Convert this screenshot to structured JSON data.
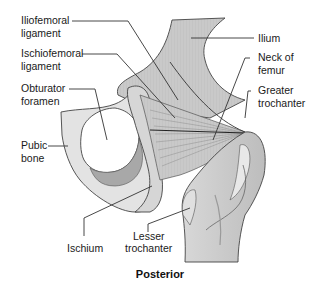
{
  "diagram": {
    "view_title": "Posterior",
    "labels": {
      "iliofemoral": [
        "Iliofemoral",
        "ligament"
      ],
      "ischiofemoral": [
        "Ischiofemoral",
        "ligament"
      ],
      "obturator": [
        "Obturator",
        "foramen"
      ],
      "pubic": [
        "Pubic",
        "bone"
      ],
      "ischium": [
        "Ischium"
      ],
      "lesser_trochanter": [
        "Lesser",
        "trochanter"
      ],
      "ilium": [
        "Ilium"
      ],
      "neck_of_femur": [
        "Neck of",
        "femur"
      ],
      "greater_trochanter": [
        "Greater",
        "trochanter"
      ]
    },
    "colors": {
      "bone_light": "#e6e6e6",
      "bone_mid": "#cfcfcf",
      "bone_dark": "#a9a9a9",
      "ligament": "#bdbdbd",
      "line": "#333333",
      "background": "#ffffff"
    }
  }
}
